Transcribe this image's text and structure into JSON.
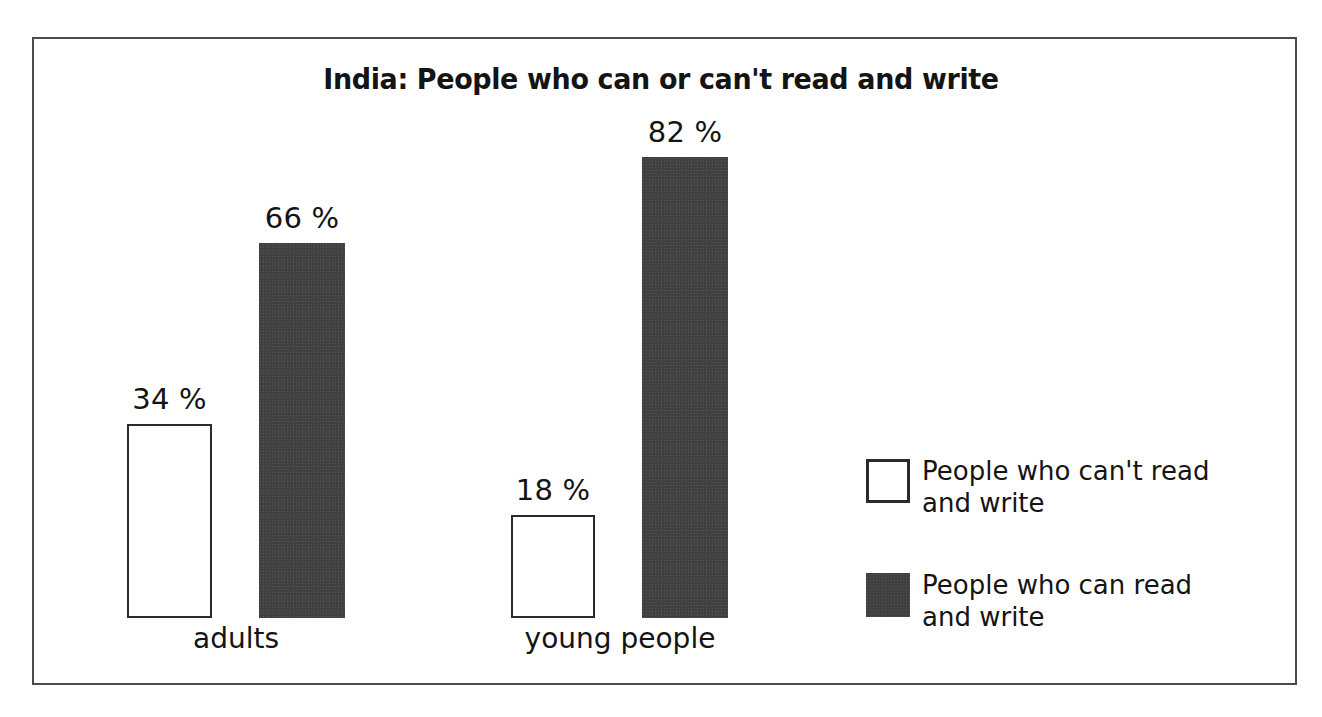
{
  "chart_data": {
    "type": "bar",
    "title": "India: People who can or can't read and write",
    "xlabel": "",
    "ylabel": "",
    "ylim": [
      0,
      100
    ],
    "grid": false,
    "legend_position": "right",
    "value_suffix": "%",
    "categories": [
      "adults",
      "young people"
    ],
    "series": [
      {
        "name": "People who can't read and write",
        "style": "light",
        "values": [
          34,
          18
        ],
        "labels": [
          "34 %",
          "18 %"
        ]
      },
      {
        "name": "People who can read and write",
        "style": "dark",
        "values": [
          66,
          82
        ],
        "labels": [
          "66 %",
          "82 %"
        ]
      }
    ],
    "bars": [
      {
        "group": "adults",
        "series": "People who can't read and write",
        "style": "light",
        "value": 34,
        "label": "34 %",
        "x": 127,
        "width": 85,
        "top": 424,
        "height": 194
      },
      {
        "group": "adults",
        "series": "People who can read and write",
        "style": "dark",
        "value": 66,
        "label": "66 %",
        "x": 259,
        "width": 86,
        "top": 243,
        "height": 375
      },
      {
        "group": "young people",
        "series": "People who can't read and write",
        "style": "light",
        "value": 18,
        "label": "18 %",
        "x": 511,
        "width": 84,
        "top": 515,
        "height": 103
      },
      {
        "group": "young people",
        "series": "People who can read and write",
        "style": "dark",
        "value": 82,
        "label": "82 %",
        "x": 642,
        "width": 86,
        "top": 157,
        "height": 461
      }
    ],
    "group_labels": [
      {
        "text": "adults",
        "center_x": 236,
        "top": 622
      },
      {
        "text": "young people",
        "center_x": 620,
        "top": 622
      }
    ]
  },
  "legend": {
    "items": [
      {
        "swatch": "light",
        "label": "People who can't read\nand write"
      },
      {
        "swatch": "dark",
        "label": "People who can read\nand write"
      }
    ]
  },
  "colors": {
    "frame": "#4a4a4a",
    "bar_dark": "#404040",
    "bar_light": "#ffffff",
    "bar_outline": "#2b2b2b",
    "text": "#141414",
    "background": "#ffffff"
  }
}
